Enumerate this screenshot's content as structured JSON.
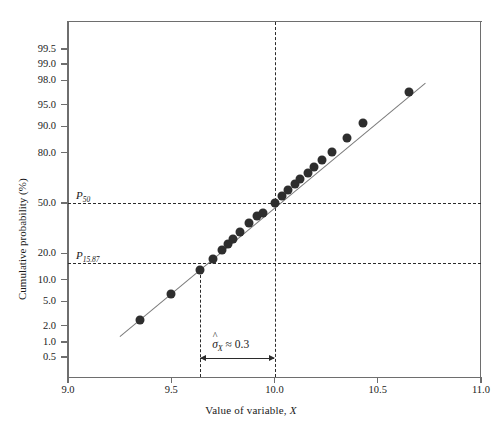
{
  "chart_data": {
    "type": "scatter",
    "title": "",
    "xlabel": "Value of variable, X",
    "ylabel": "Cumulative probability (%)",
    "xlim": [
      9.0,
      11.0
    ],
    "x_ticks": [
      9.0,
      9.5,
      10.0,
      10.5,
      11.0
    ],
    "x_tick_labels": [
      "9.0",
      "9.5",
      "10.0",
      "10.5",
      "11.0"
    ],
    "y_scale": "probability (normal probit)",
    "y_ticks": [
      0.5,
      1.0,
      2.0,
      5.0,
      10.0,
      20.0,
      50.0,
      80.0,
      90.0,
      95.0,
      98.0,
      99.0,
      99.5
    ],
    "y_tick_labels": [
      "0.5",
      "1.0",
      "2.0",
      "5.0",
      "10.0",
      "20.0",
      "50.0",
      "80.0",
      "90.0",
      "95.0",
      "98.0",
      "99.0",
      "99.5"
    ],
    "grid": false,
    "legend": "none",
    "series": [
      {
        "name": "Sample cumulative probability",
        "marker": "filled-circle",
        "marker_color": "#2e2e2e",
        "points": [
          {
            "x": 9.35,
            "p": 2.5
          },
          {
            "x": 9.5,
            "p": 6.5
          },
          {
            "x": 9.64,
            "p": 13.0
          },
          {
            "x": 9.7,
            "p": 17.5
          },
          {
            "x": 9.745,
            "p": 21.5
          },
          {
            "x": 9.775,
            "p": 24.5
          },
          {
            "x": 9.8,
            "p": 27.5
          },
          {
            "x": 9.835,
            "p": 31.5
          },
          {
            "x": 9.875,
            "p": 37.0
          },
          {
            "x": 9.915,
            "p": 41.5
          },
          {
            "x": 9.945,
            "p": 43.5
          },
          {
            "x": 10.0,
            "p": 50.0
          },
          {
            "x": 10.035,
            "p": 54.5
          },
          {
            "x": 10.065,
            "p": 58.5
          },
          {
            "x": 10.1,
            "p": 62.5
          },
          {
            "x": 10.125,
            "p": 65.5
          },
          {
            "x": 10.16,
            "p": 69.0
          },
          {
            "x": 10.19,
            "p": 72.5
          },
          {
            "x": 10.23,
            "p": 76.5
          },
          {
            "x": 10.28,
            "p": 80.5
          },
          {
            "x": 10.35,
            "p": 86.0
          },
          {
            "x": 10.43,
            "p": 91.0
          },
          {
            "x": 10.65,
            "p": 96.8
          }
        ]
      }
    ],
    "fit_line": {
      "name": "Fitted straight line",
      "color": "#7a7a7a",
      "x_start": 9.25,
      "p_start": 1.3,
      "x_end": 10.73,
      "p_end": 97.8
    },
    "reference_lines": [
      {
        "name": "P50",
        "orientation": "horizontal",
        "value": 50.0,
        "label": "P",
        "label_sub": "50",
        "style": "dashed"
      },
      {
        "name": "P15.87",
        "orientation": "horizontal",
        "value": 15.87,
        "label": "P",
        "label_sub": "15.87",
        "style": "dashed"
      },
      {
        "name": "x-at-P15.87",
        "orientation": "vertical",
        "value": 9.64,
        "style": "dashed"
      },
      {
        "name": "x-at-P50",
        "orientation": "vertical",
        "value": 10.0,
        "style": "dashed"
      }
    ],
    "annotations": [
      {
        "name": "sigma-estimate",
        "symbol": "σ",
        "hat": "^",
        "subscript": "X",
        "relation": "≈",
        "value": "0.3",
        "text": "σ̂X ≈ 0.3",
        "span_from_x": 9.64,
        "span_to_x": 10.0,
        "arrow": "double-headed"
      }
    ]
  },
  "labels": {
    "y_axis_title": "Cumulative probability (%)",
    "x_axis_title_prefix": "Value of variable, ",
    "x_axis_title_var": "X",
    "p50_main": "P",
    "p50_sub": "50",
    "p1587_main": "P",
    "p1587_sub": "15.87",
    "sigma_glyph": "σ",
    "sigma_hat": "^",
    "sigma_sub": "X",
    "sigma_rest": " ≈ 0.3"
  },
  "colors": {
    "axis": "#6e6e6e",
    "marker": "#2e2e2e",
    "fit_line": "#7a7a7a",
    "dashed": "#2b2b2b",
    "background": "#ffffff"
  }
}
